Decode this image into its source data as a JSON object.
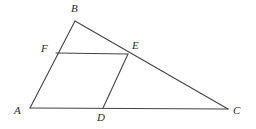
{
  "figure": {
    "kind": "geometry-diagram",
    "background_color": "#ffffff",
    "stroke_color": "#444444",
    "label_color": "#2b2b2b",
    "stroke_width": 1.1,
    "canvas": {
      "width": 256,
      "height": 129
    }
  },
  "points": {
    "A": {
      "label": "A",
      "x": 30,
      "y": 108,
      "label_x": 14,
      "label_y": 105
    },
    "B": {
      "label": "B",
      "x": 75,
      "y": 21,
      "label_x": 71,
      "label_y": 3
    },
    "C": {
      "label": "C",
      "x": 228,
      "y": 109,
      "label_x": 233,
      "label_y": 105
    },
    "D": {
      "label": "D",
      "x": 103,
      "y": 108,
      "label_x": 97,
      "label_y": 112
    },
    "E": {
      "label": "E",
      "x": 128,
      "y": 54,
      "label_x": 132,
      "label_y": 40
    },
    "F": {
      "label": "F",
      "x": 56,
      "y": 53,
      "label_x": 41,
      "label_y": 43
    }
  },
  "segments": [
    {
      "name": "segment-AB",
      "from": "A",
      "to": "B"
    },
    {
      "name": "segment-BC",
      "from": "B",
      "to": "C"
    },
    {
      "name": "segment-AC",
      "from": "A",
      "to": "C"
    },
    {
      "name": "segment-FE",
      "from": "F",
      "to": "E"
    },
    {
      "name": "segment-DE",
      "from": "D",
      "to": "E"
    }
  ]
}
